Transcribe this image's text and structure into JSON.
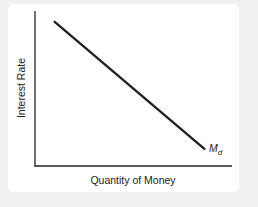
{
  "chart_data": {
    "type": "line",
    "title": "",
    "xlabel": "Quantity of Money",
    "ylabel": "Interest Rate",
    "grid": false,
    "legend": null,
    "series": [
      {
        "name": "Md",
        "label_main": "M",
        "label_sub": "d",
        "points": [
          [
            0.1,
            0.93
          ],
          [
            0.86,
            0.11
          ]
        ],
        "color": "#222222"
      }
    ],
    "xlim": [
      0,
      1
    ],
    "ylim": [
      0,
      1
    ],
    "ticks": "none"
  },
  "colors": {
    "background": "#f1f1f1",
    "card": "#ffffff",
    "ink": "#222222"
  }
}
